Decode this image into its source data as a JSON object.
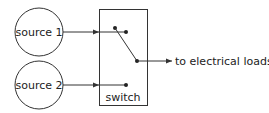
{
  "diagram": {
    "type": "electrical-switch-schematic",
    "stroke_color": "#333333",
    "background": "#ffffff",
    "nodes": {
      "source1": {
        "label": "source 1",
        "cx": 39,
        "cy": 32,
        "r": 24
      },
      "source2": {
        "label": "source 2",
        "cx": 39,
        "cy": 85,
        "r": 24
      },
      "switch": {
        "label": "switch",
        "x": 99,
        "y": 9,
        "width": 48,
        "height": 96
      }
    },
    "output": {
      "label": "to electrical loads"
    },
    "edges": [
      {
        "from": "source 1",
        "to": "switch",
        "arrow": true
      },
      {
        "from": "source 2",
        "to": "switch",
        "arrow": true
      },
      {
        "from": "switch",
        "to": "to electrical loads",
        "arrow": true
      }
    ],
    "switch_state": "connected to source 1"
  }
}
